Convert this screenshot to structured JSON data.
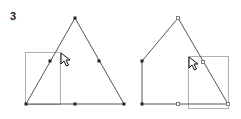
{
  "step": {
    "label": "3"
  },
  "colors": {
    "edge": "#555555",
    "selection_rect": "#b0b0b0",
    "point_fill": "#222222",
    "point_hollow_stroke": "#666666",
    "cursor": "#111111"
  },
  "figures": [
    {
      "name": "before",
      "shape": "triangle",
      "vertices": [
        [
          26,
          104
        ],
        [
          75,
          18
        ],
        [
          124,
          104
        ]
      ],
      "filled_points": [
        [
          26,
          104
        ],
        [
          75,
          18
        ],
        [
          124,
          104
        ],
        [
          50,
          61
        ],
        [
          99,
          61
        ],
        [
          75,
          104
        ]
      ],
      "hollow_points": [],
      "selection_rect": {
        "x": 25,
        "y": 52,
        "w": 35,
        "h": 52
      },
      "cursor": {
        "x": 61,
        "y": 53
      }
    },
    {
      "name": "after",
      "shape": "pentagon",
      "vertices": [
        [
          142,
          104
        ],
        [
          142,
          61
        ],
        [
          178,
          18
        ],
        [
          228,
          104
        ]
      ],
      "filled_points": [
        [
          142,
          104
        ],
        [
          142,
          61
        ]
      ],
      "hollow_points": [
        [
          178,
          18
        ],
        [
          203,
          62
        ],
        [
          178,
          104
        ],
        [
          228,
          104
        ]
      ],
      "selection_rect": {
        "x": 188,
        "y": 56,
        "w": 40,
        "h": 52
      },
      "cursor": {
        "x": 189,
        "y": 57
      }
    }
  ]
}
